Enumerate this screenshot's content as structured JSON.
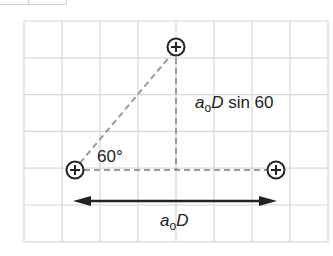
{
  "diagram": {
    "grid": {
      "x0": 24,
      "y0": 21,
      "cols": 8,
      "rows": 6,
      "cell_w": 38,
      "cell_h": 36.8,
      "color": "#d6d6d6"
    },
    "atoms": [
      {
        "id": "top",
        "x": 176,
        "y": 47,
        "symbol": "+"
      },
      {
        "id": "left",
        "x": 75,
        "y": 170,
        "symbol": "+"
      },
      {
        "id": "right",
        "x": 276,
        "y": 170,
        "symbol": "+"
      }
    ],
    "labels": {
      "angle": "60°",
      "height_prefix": "a",
      "height_sub": "o",
      "height_var": "D",
      "height_suffix": " sin 60",
      "base_prefix": "a",
      "base_sub": "o",
      "base_var": "D"
    },
    "colors": {
      "line": "#222222",
      "dashed": "#9a9a9a",
      "grid": "#d6d6d6"
    }
  }
}
